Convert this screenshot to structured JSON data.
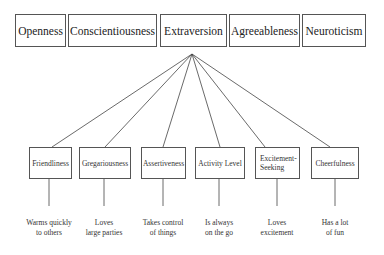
{
  "traits": [
    {
      "label": "Openness"
    },
    {
      "label": "Conscientiousness"
    },
    {
      "label": "Extraversion"
    },
    {
      "label": "Agreeableness"
    },
    {
      "label": "Neuroticism"
    }
  ],
  "expanded_trait": "Extraversion",
  "facets": [
    {
      "label": "Friendliness",
      "description_line1": "Warms quickly",
      "description_line2": "to others"
    },
    {
      "label": "Gregariousness",
      "description_line1": "Loves",
      "description_line2": "large parties"
    },
    {
      "label": "Assertiveness",
      "description_line1": "Takes control",
      "description_line2": "of things"
    },
    {
      "label": "Activity Level",
      "description_line1": "Is always",
      "description_line2": "on the go"
    },
    {
      "label": "Excitement-Seeking",
      "description_line1": "Loves",
      "description_line2": "excitement"
    },
    {
      "label": "Cheerfulness",
      "description_line1": "Has a lot",
      "description_line2": "of fun"
    }
  ]
}
